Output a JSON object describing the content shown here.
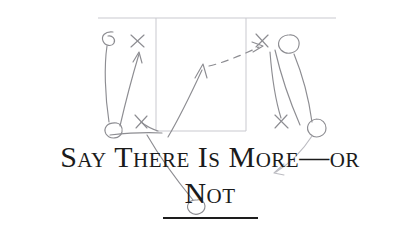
{
  "page": {
    "width": 420,
    "height": 234,
    "background_color": "#ffffff",
    "kind": "book-chapter-heading-with-pencil-sketch"
  },
  "heading": {
    "line_1": "Say There Is More—or",
    "line_2": "Not",
    "full_text": "Say There Is More—or Not",
    "style": "small-caps-serif",
    "text_color": "#1b1b1b",
    "rule": {
      "label": "heading-rule",
      "color": "#1d1d1d",
      "x": 163,
      "y": 217,
      "width": 95,
      "height": 2
    }
  },
  "diagram": {
    "medium": "pencil",
    "stroke_color": "#8d8d92",
    "court_line_color": "#c9c9cf",
    "court": {
      "baseline": {
        "x1": 98,
        "y1": 18,
        "x2": 336,
        "y2": 18
      },
      "lane_left": {
        "x1": 156,
        "y1": 18,
        "x2": 156,
        "y2": 131
      },
      "lane_right": {
        "x1": 246,
        "y1": 18,
        "x2": 246,
        "y2": 131
      },
      "free_throw_line": {
        "x1": 156,
        "y1": 131,
        "x2": 246,
        "y2": 131
      }
    },
    "players": [
      {
        "name": "offense-top-left",
        "marker": "circle",
        "x": 110,
        "y": 39,
        "r": 7
      },
      {
        "name": "offense-bottom-left",
        "marker": "circle",
        "x": 113,
        "y": 130,
        "r": 8
      },
      {
        "name": "offense-top-right",
        "marker": "circle",
        "x": 291,
        "y": 45,
        "r": 10
      },
      {
        "name": "offense-bottom-right",
        "marker": "circle",
        "x": 320,
        "y": 128,
        "r": 9
      },
      {
        "name": "offense-under-not",
        "marker": "circle",
        "x": 199,
        "y": 207,
        "r": 8
      }
    ],
    "defenders": [
      {
        "name": "defender-top-left",
        "marker": "x",
        "x": 137,
        "y": 41,
        "size": 8
      },
      {
        "name": "defender-mid-left",
        "marker": "x",
        "x": 141,
        "y": 121,
        "size": 8
      },
      {
        "name": "defender-top-right",
        "marker": "x",
        "x": 262,
        "y": 41,
        "size": 8
      },
      {
        "name": "defender-bottom-right",
        "marker": "x",
        "x": 281,
        "y": 121,
        "size": 8
      }
    ],
    "movements": [
      {
        "name": "cut-left-outside",
        "style": "solid-arrow"
      },
      {
        "name": "cut-left-inner",
        "style": "solid-arrow"
      },
      {
        "name": "cut-baseline-to-elbow",
        "style": "solid-arrow"
      },
      {
        "name": "pass-to-wing",
        "style": "dashed-arrow"
      },
      {
        "name": "screen-right-down",
        "style": "solid-arrow"
      },
      {
        "name": "drive-right-corner",
        "style": "solid-arrow"
      },
      {
        "name": "cut-down-to-not",
        "style": "solid-arrow"
      }
    ]
  }
}
